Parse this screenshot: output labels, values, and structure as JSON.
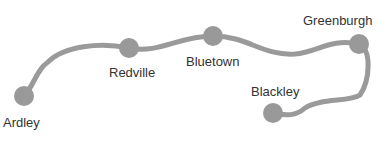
{
  "diagram": {
    "type": "route-map",
    "line_color": "#9a9a9a",
    "stops": [
      {
        "name": "Ardley",
        "x": 24,
        "y": 96
      },
      {
        "name": "Redville",
        "x": 129,
        "y": 48
      },
      {
        "name": "Bluetown",
        "x": 213,
        "y": 36
      },
      {
        "name": "Greenburgh",
        "x": 359,
        "y": 44
      },
      {
        "name": "Blackley",
        "x": 273,
        "y": 113
      }
    ]
  }
}
